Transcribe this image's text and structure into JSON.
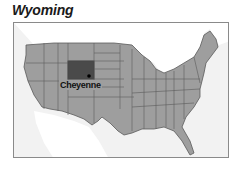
{
  "title": "Wyoming",
  "map": {
    "highlighted_state": "Wyoming",
    "capital": {
      "name": "Cheyenne"
    },
    "colors": {
      "land": "#9e9e9e",
      "highlight": "#4a4a4a",
      "borders": "#5a5a5a",
      "water": "#f2f2f2",
      "outside_land": "#ffffff"
    }
  }
}
